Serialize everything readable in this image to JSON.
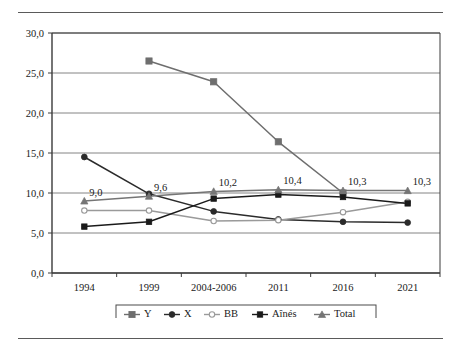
{
  "chart_data": {
    "type": "line",
    "title": "",
    "subtitle": "",
    "xlabel": "",
    "ylabel": "",
    "categories": [
      "1994",
      "1999",
      "2004-2006",
      "2011",
      "2016",
      "2021"
    ],
    "ylim": [
      0.0,
      30.0
    ],
    "yticks": [
      "0,0",
      "5,0",
      "10,0",
      "15,0",
      "20,0",
      "25,0",
      "30,0"
    ],
    "ytick_values": [
      0.0,
      5.0,
      10.0,
      15.0,
      20.0,
      25.0,
      30.0
    ],
    "grid": "horizontal",
    "legend_position": "bottom",
    "decimal_separator": ",",
    "series": [
      {
        "name": "Y",
        "color": "#6e6e6e",
        "marker": "square",
        "values": [
          null,
          26.5,
          23.9,
          16.4,
          10.0,
          null
        ]
      },
      {
        "name": "X",
        "color": "#2b2b2b",
        "marker": "circle",
        "values": [
          14.5,
          9.9,
          7.7,
          6.7,
          6.4,
          6.3
        ]
      },
      {
        "name": "BB",
        "color": "#9a9a9a",
        "marker": "open-circle",
        "values": [
          7.8,
          7.8,
          6.5,
          6.6,
          7.6,
          8.9
        ]
      },
      {
        "name": "Aînés",
        "color": "#1a1a1a",
        "marker": "filled-square",
        "values": [
          5.8,
          6.4,
          9.3,
          9.8,
          9.5,
          8.7
        ]
      },
      {
        "name": "Total",
        "color": "#757575",
        "marker": "triangle",
        "values": [
          9.0,
          9.6,
          10.2,
          10.4,
          10.3,
          10.3
        ]
      }
    ],
    "data_labels": [
      {
        "series": "Total",
        "category": "1994",
        "text": "9,0",
        "value": 9.0
      },
      {
        "series": "Total",
        "category": "1999",
        "text": "9,6",
        "value": 9.6
      },
      {
        "series": "Total",
        "category": "2004-2006",
        "text": "10,2",
        "value": 10.2
      },
      {
        "series": "Total",
        "category": "2011",
        "text": "10,4",
        "value": 10.4
      },
      {
        "series": "Total",
        "category": "2016",
        "text": "10,3",
        "value": 10.3
      },
      {
        "series": "Total",
        "category": "2021",
        "text": "10,3",
        "value": 10.3
      }
    ],
    "legend": [
      {
        "label": "Y",
        "color": "#6e6e6e",
        "marker": "square"
      },
      {
        "label": "X",
        "color": "#2b2b2b",
        "marker": "circle"
      },
      {
        "label": "BB",
        "color": "#9a9a9a",
        "marker": "open-circle"
      },
      {
        "label": "Aînés",
        "color": "#1a1a1a",
        "marker": "filled-square"
      },
      {
        "label": "Total",
        "color": "#757575",
        "marker": "triangle"
      }
    ]
  },
  "colors": {
    "axis": "#3a3a3a",
    "grid": "#777777",
    "rule": "#5a5a5a",
    "background": "#ffffff"
  }
}
